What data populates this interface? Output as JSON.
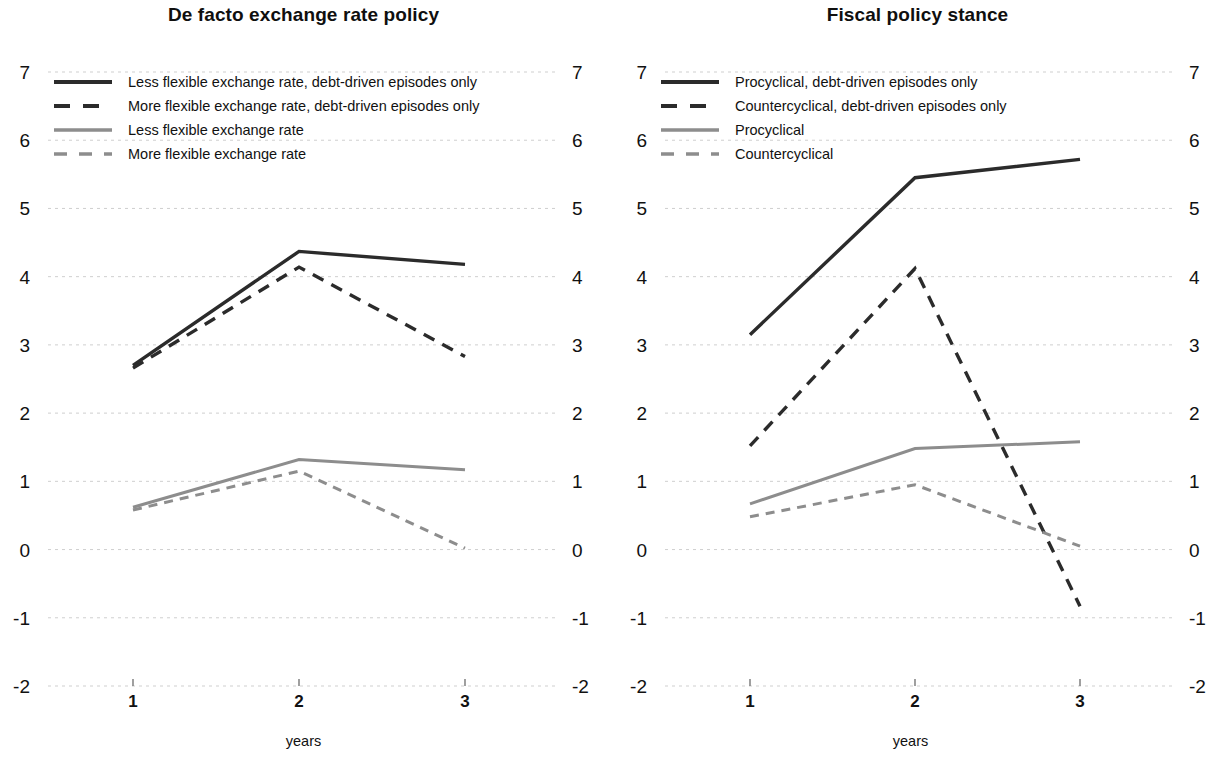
{
  "figure": {
    "background": "#ffffff",
    "panel_count": 2
  },
  "colors": {
    "dark": "#2b2b2b",
    "gray": "#8d8d8d",
    "grid": "#cfcfcf",
    "text": "#111111"
  },
  "panels": [
    {
      "id": "left",
      "title": "De facto exchange rate policy",
      "xlabel": "years",
      "legend": [
        {
          "label": "Less flexible exchange rate, debt-driven episodes only",
          "style": "solid",
          "color": "#2b2b2b",
          "width": 3.4
        },
        {
          "label": "More flexible exchange rate, debt-driven episodes only",
          "style": "dashed",
          "color": "#2b2b2b",
          "width": 3.4
        },
        {
          "label": "Less flexible exchange rate",
          "style": "solid",
          "color": "#8d8d8d",
          "width": 3.0
        },
        {
          "label": "More flexible exchange rate",
          "style": "dashed",
          "color": "#8d8d8d",
          "width": 3.0
        }
      ]
    },
    {
      "id": "right",
      "title": "Fiscal policy stance",
      "xlabel": "years",
      "legend": [
        {
          "label": "Procyclical, debt-driven episodes only",
          "style": "solid",
          "color": "#2b2b2b",
          "width": 3.4
        },
        {
          "label": "Countercyclical, debt-driven episodes only",
          "style": "dashed",
          "color": "#2b2b2b",
          "width": 3.4
        },
        {
          "label": "Procyclical",
          "style": "solid",
          "color": "#8d8d8d",
          "width": 3.0
        },
        {
          "label": "Countercyclical",
          "style": "dashed",
          "color": "#8d8d8d",
          "width": 3.0
        }
      ]
    }
  ],
  "chart_data": [
    {
      "type": "line",
      "panel": "left",
      "title": "De facto exchange rate policy",
      "xlabel": "years",
      "ylabel": "",
      "x": [
        1,
        2,
        3
      ],
      "xtick_labels": [
        "1",
        "2",
        "3"
      ],
      "ytick_labels": [
        "-2",
        "-1",
        "0",
        "1",
        "2",
        "3",
        "4",
        "5",
        "6",
        "7"
      ],
      "yticks": [
        -2,
        -1,
        0,
        1,
        2,
        3,
        4,
        5,
        6,
        7
      ],
      "ylim": [
        -2,
        7
      ],
      "xlim": [
        0.55,
        3.45
      ],
      "grid": true,
      "y_axis_both_sides": true,
      "legend_position": "top-left",
      "series": [
        {
          "name": "Less flexible exchange rate, debt-driven episodes only",
          "style": "solid",
          "color": "#2b2b2b",
          "values": [
            2.7,
            4.37,
            4.18
          ]
        },
        {
          "name": "More flexible exchange rate, debt-driven episodes only",
          "style": "dashed",
          "color": "#2b2b2b",
          "values": [
            2.66,
            4.14,
            2.83
          ]
        },
        {
          "name": "Less flexible exchange rate",
          "style": "solid",
          "color": "#8d8d8d",
          "values": [
            0.62,
            1.32,
            1.17
          ]
        },
        {
          "name": "More flexible exchange rate",
          "style": "dashed",
          "color": "#8d8d8d",
          "values": [
            0.58,
            1.15,
            0.02
          ]
        }
      ]
    },
    {
      "type": "line",
      "panel": "right",
      "title": "Fiscal policy stance",
      "xlabel": "years",
      "ylabel": "",
      "x": [
        1,
        2,
        3
      ],
      "xtick_labels": [
        "1",
        "2",
        "3"
      ],
      "ytick_labels": [
        "-2",
        "-1",
        "0",
        "1",
        "2",
        "3",
        "4",
        "5",
        "6",
        "7"
      ],
      "yticks": [
        -2,
        -1,
        0,
        1,
        2,
        3,
        4,
        5,
        6,
        7
      ],
      "ylim": [
        -2,
        7
      ],
      "xlim": [
        0.55,
        3.45
      ],
      "grid": true,
      "y_axis_both_sides": true,
      "legend_position": "top-left",
      "series": [
        {
          "name": "Procyclical, debt-driven episodes only",
          "style": "solid",
          "color": "#2b2b2b",
          "values": [
            3.15,
            5.45,
            5.72
          ]
        },
        {
          "name": "Countercyclical, debt-driven episodes only",
          "style": "dashed",
          "color": "#2b2b2b",
          "values": [
            1.52,
            4.12,
            -0.83
          ]
        },
        {
          "name": "Procyclical",
          "style": "solid",
          "color": "#8d8d8d",
          "values": [
            0.67,
            1.48,
            1.58
          ]
        },
        {
          "name": "Countercyclical",
          "style": "dashed",
          "color": "#8d8d8d",
          "values": [
            0.48,
            0.95,
            0.05
          ]
        }
      ]
    }
  ]
}
